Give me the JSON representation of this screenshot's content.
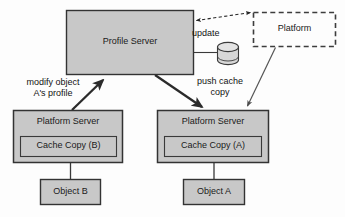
{
  "diagram": {
    "colors": {
      "node_fill": "#c8c8c8",
      "node_stroke": "#333333",
      "background": "#fdfdfd",
      "text": "#1a1a1a",
      "thick_arrow": "#2b2b2b",
      "thin_arrow": "#555555",
      "dashed_stroke": "#444444"
    },
    "nodes": {
      "profile_server": {
        "label": "Profile Server",
        "shape": "rectangle",
        "style": "solid-filled",
        "x": 66,
        "y": 10,
        "w": 128,
        "h": 65
      },
      "platform": {
        "label": "Platform",
        "shape": "rectangle",
        "style": "dashed-outline",
        "x": 253,
        "y": 12,
        "w": 83,
        "h": 35
      },
      "database": {
        "label": "",
        "shape": "cylinder",
        "style": "solid-outline",
        "x": 217,
        "y": 42,
        "w": 21,
        "h": 23
      },
      "platform_server_left": {
        "label": "Platform Server",
        "shape": "rectangle",
        "style": "solid-filled",
        "x": 13,
        "y": 110,
        "w": 110,
        "h": 53
      },
      "cache_copy_b": {
        "label": "Cache Copy (B)",
        "shape": "rectangle",
        "style": "solid-filled-inner",
        "x": 20,
        "y": 136,
        "w": 97,
        "h": 21
      },
      "object_b": {
        "label": "Object B",
        "shape": "rectangle",
        "style": "solid-filled",
        "x": 40,
        "y": 179,
        "w": 61,
        "h": 26
      },
      "platform_server_right": {
        "label": "Platform Server",
        "shape": "rectangle",
        "style": "solid-filled",
        "x": 157,
        "y": 110,
        "w": 112,
        "h": 53
      },
      "cache_copy_a": {
        "label": "Cache Copy (A)",
        "shape": "rectangle",
        "style": "solid-filled-inner",
        "x": 164,
        "y": 136,
        "w": 98,
        "h": 21
      },
      "object_a": {
        "label": "Object A",
        "shape": "rectangle",
        "style": "solid-filled",
        "x": 183,
        "y": 179,
        "w": 62,
        "h": 26
      }
    },
    "edges": [
      {
        "name": "profile-server-to-platform",
        "label": "",
        "from": "profile_server",
        "to": "platform",
        "style": "dashed",
        "arrowheads": "both"
      },
      {
        "name": "profile-server-to-database",
        "label": "update",
        "from": "profile_server",
        "to": "database",
        "style": "solid-thin",
        "arrowheads": "none"
      },
      {
        "name": "platform-server-left-to-profile-server",
        "label": "modify object A's profile",
        "label_line1": "modify object",
        "label_line2": "A's profile",
        "from": "platform_server_left",
        "to": "profile_server",
        "style": "solid-thick",
        "arrowheads": "end"
      },
      {
        "name": "profile-server-to-platform-server-right",
        "label": "push cache copy",
        "label_line1": "push cache",
        "label_line2": "copy",
        "from": "profile_server",
        "to": "platform_server_right",
        "style": "solid-thick",
        "arrowheads": "end"
      },
      {
        "name": "platform-to-platform-server-right",
        "label": "",
        "from": "platform",
        "to": "platform_server_right",
        "style": "solid-thin",
        "arrowheads": "end"
      },
      {
        "name": "cache-copy-b-to-object-b",
        "label": "",
        "from": "cache_copy_b",
        "to": "object_b",
        "style": "solid-thin",
        "arrowheads": "none"
      },
      {
        "name": "cache-copy-a-to-object-a",
        "label": "",
        "from": "cache_copy_a",
        "to": "object_a",
        "style": "solid-thin",
        "arrowheads": "none"
      }
    ]
  }
}
